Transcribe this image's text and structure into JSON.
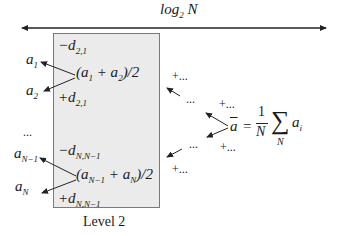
{
  "diagram": {
    "axis": {
      "label_base": "log",
      "label_sub": "2",
      "label_var": "N"
    },
    "level_box": {
      "caption": "Level 2",
      "fill": "#ebebeb",
      "border": "#7a7a7a",
      "top_group": {
        "minus_d": "−d",
        "minus_d_sub": "2,1",
        "average": "(a",
        "avg_sub1": "1",
        "avg_mid": " + a",
        "avg_sub2": "2",
        "avg_end": ")/2",
        "plus_d": "+d",
        "plus_d_sub": "2,1"
      },
      "bottom_group": {
        "minus_d": "−d",
        "minus_d_sub": "N,N−1",
        "average": "(a",
        "avg_sub1": "N−1",
        "avg_mid": " + a",
        "avg_sub2": "N",
        "avg_end": ")/2",
        "plus_d": "+d",
        "plus_d_sub": "N,N−1"
      }
    },
    "left_outputs": {
      "a1": "a",
      "a1_sub": "1",
      "a2": "a",
      "a2_sub": "2",
      "ellipsis": "...",
      "aN1": "a",
      "aN1_sub": "N−1",
      "aN": "a",
      "aN_sub": "N"
    },
    "right_side": {
      "plus_dots": "+...",
      "dots": "...",
      "mean_lhs": "a",
      "mean_eq": "=",
      "frac_num": "1",
      "frac_den": "N",
      "sigma": "∑",
      "sigma_sub": "N",
      "mean_term": "a",
      "mean_term_sub": "i"
    }
  }
}
